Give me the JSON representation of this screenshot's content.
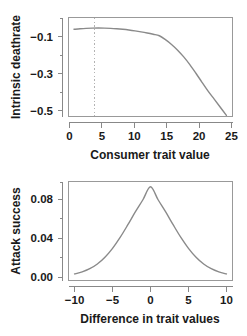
{
  "figure": {
    "background": "#ffffff",
    "curve_color": "#8a8a8a",
    "axis_color": "#888888",
    "box_color": "#999999",
    "marker_color": "#b3b3b3"
  },
  "chart_data": [
    {
      "id": "intrinsic-deathrate",
      "type": "line",
      "title": "",
      "xlabel": "Consumer trait value",
      "ylabel": "Intrinsic deathrate",
      "xlim": [
        -0.9,
        26.0
      ],
      "ylim": [
        -0.56,
        -0.045
      ],
      "xticks": [
        0,
        5,
        10,
        15,
        20,
        25
      ],
      "xticklabels": [
        "0",
        "5",
        "10",
        "15",
        "20",
        "25"
      ],
      "yticks": [
        -0.1,
        -0.3,
        -0.5
      ],
      "yticklabels": [
        "−0.1",
        "−0.3",
        "−0.5"
      ],
      "yminorticks": [
        -0.2,
        -0.4
      ],
      "grid": false,
      "legend": null,
      "annotations": [
        {
          "name": "optimum-marker",
          "type": "vertical-dotted-line",
          "x": 4.0,
          "label": ""
        }
      ],
      "series": [
        {
          "name": "intrinsic deathrate",
          "x": [
            0,
            1,
            2,
            3,
            4,
            5,
            6,
            7,
            8,
            9,
            10,
            11,
            12,
            13,
            14,
            15,
            16,
            17,
            18,
            19,
            20,
            21,
            22,
            23,
            24,
            25
          ],
          "y": [
            -0.1064,
            -0.1036,
            -0.1016,
            -0.1004,
            -0.1,
            -0.1004,
            -0.1016,
            -0.1036,
            -0.1064,
            -0.11,
            -0.1144,
            -0.1196,
            -0.1256,
            -0.1324,
            -0.14,
            -0.16,
            -0.185,
            -0.215,
            -0.25,
            -0.29,
            -0.335,
            -0.382,
            -0.428,
            -0.47,
            -0.512,
            -0.554
          ]
        }
      ]
    },
    {
      "id": "attack-success",
      "type": "line",
      "title": "",
      "xlabel": "Difference in trait values",
      "ylabel": "Attack success",
      "xlim": [
        -10.8,
        10.8
      ],
      "ylim": [
        -0.004,
        0.0985
      ],
      "xticks": [
        -10,
        -5,
        0,
        5,
        10
      ],
      "xticklabels": [
        "−10",
        "−5",
        "0",
        "5",
        "10"
      ],
      "yticks": [
        0.0,
        0.04,
        0.08
      ],
      "yticklabels": [
        "0.00",
        "0.04",
        "0.08"
      ],
      "yminorticks": [
        0.02,
        0.06
      ],
      "grid": false,
      "legend": null,
      "annotations": [],
      "series": [
        {
          "name": "attack success",
          "peak_x": 0,
          "peak_y": 0.093,
          "x": [
            -10,
            -9,
            -8,
            -7,
            -6,
            -5,
            -4,
            -3,
            -2,
            -1,
            0,
            1,
            2,
            3,
            4,
            5,
            6,
            7,
            8,
            9,
            10
          ],
          "y": [
            0.0028,
            0.0049,
            0.0082,
            0.0131,
            0.0201,
            0.0293,
            0.0406,
            0.0535,
            0.067,
            0.0796,
            0.093,
            0.0796,
            0.067,
            0.0535,
            0.0406,
            0.0293,
            0.0201,
            0.0131,
            0.0082,
            0.0049,
            0.0028
          ]
        }
      ]
    }
  ]
}
